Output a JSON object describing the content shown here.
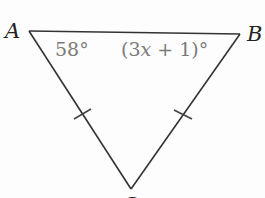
{
  "figure": {
    "type": "isosceles-triangle",
    "vertices": {
      "A": {
        "label": "A",
        "x": 29,
        "y": 31
      },
      "B": {
        "label": "B",
        "x": 240,
        "y": 34
      },
      "C": {
        "label": "C",
        "x": 131,
        "y": 189
      }
    },
    "angles": {
      "A": {
        "label": "58°"
      },
      "B": {
        "label_prefix": "(3",
        "label_var": "x",
        "label_suffix": " + 1)°"
      }
    },
    "congruent_sides": [
      "AC",
      "BC"
    ],
    "colors": {
      "stroke": "#333333",
      "angle_text": "#7a7a7a",
      "vertex_text": "#222222"
    }
  }
}
